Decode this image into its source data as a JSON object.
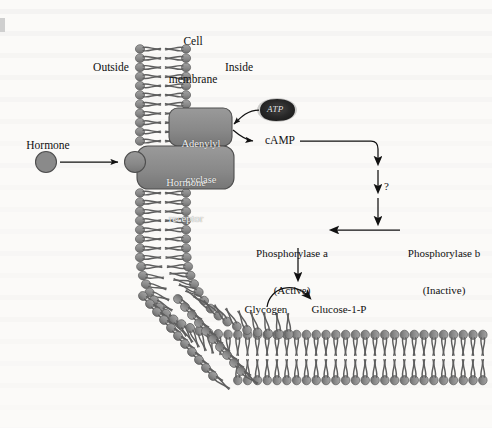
{
  "figure": {
    "type": "diagram",
    "background_color": "#fbfaf8",
    "ink_color": "#111111",
    "membrane_head_color": "#8c8c8c",
    "membrane_tail_color": "#6f6f6f",
    "protein_fill_color": "#8a8a8a",
    "protein_stroke_color": "#4a4a4a"
  },
  "labels": {
    "cell_membrane_line1": "Cell",
    "cell_membrane_line2": "membrane",
    "outside": "Outside",
    "inside": "Inside",
    "hormone": "Hormone",
    "hormone_receptor_line1": "Hormone",
    "hormone_receptor_line2": "receptor",
    "adenylyl_cyclase_line1": "Adenylyl",
    "adenylyl_cyclase_line2": "cyclase",
    "atp": "ATP",
    "camp": "cAMP",
    "question_mark": "?",
    "phosphorylase_a_line1": "Phosphorylase a",
    "phosphorylase_a_line2": "(Active)",
    "phosphorylase_b_line1": "Phosphorylase b",
    "phosphorylase_b_line2": "(Inactive)",
    "glycogen": "Glycogen",
    "glucose_1_p": "Glucose-1-P"
  },
  "structures": [
    {
      "name": "phospholipid-bilayer",
      "shape": "vertical column curving to horizontal band at lower right"
    },
    {
      "name": "hormone-molecule",
      "shape": "filled circle"
    },
    {
      "name": "hormone-receptor",
      "shape": "rounded rectangle spanning membrane with outer knob"
    },
    {
      "name": "adenylyl-cyclase",
      "shape": "rounded rectangle on inside face of membrane"
    },
    {
      "name": "atp-molecule",
      "shape": "dark irregular blob"
    }
  ],
  "arrows": [
    {
      "name": "hormone-to-receptor",
      "from": "Hormone",
      "to": "Hormone receptor",
      "style": "straight"
    },
    {
      "name": "atp-to-cyclase",
      "from": "ATP",
      "to": "Adenylyl cyclase",
      "style": "curved"
    },
    {
      "name": "cyclase-to-camp",
      "from": "Adenylyl cyclase",
      "to": "cAMP",
      "style": "curved"
    },
    {
      "name": "camp-to-cascade",
      "from": "cAMP",
      "to": "unknown steps",
      "style": "elbow"
    },
    {
      "name": "cascade-step-1",
      "style": "down"
    },
    {
      "name": "cascade-step-2",
      "style": "down"
    },
    {
      "name": "cascade-step-3",
      "style": "down"
    },
    {
      "name": "phosphorylase-b-to-a",
      "from": "Phosphorylase b (Inactive)",
      "to": "Phosphorylase a (Active)",
      "style": "left"
    },
    {
      "name": "phosphorylase-a-down",
      "from": "Phosphorylase a",
      "to": "reaction",
      "style": "down"
    },
    {
      "name": "glycogen-to-glucose",
      "from": "Glycogen",
      "to": "Glucose-1-P",
      "style": "curved-arc"
    }
  ]
}
